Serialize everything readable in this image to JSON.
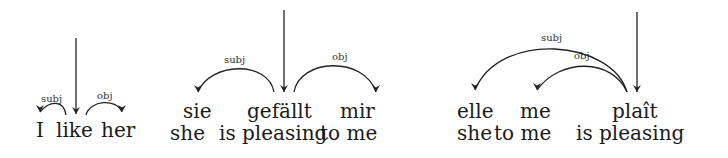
{
  "diagrams": [
    {
      "language": "English",
      "words": [
        {
          "text": "I",
          "x": 36
        },
        {
          "text": "like",
          "x": 56
        },
        {
          "text": "her",
          "x": 101
        }
      ],
      "glosses": [],
      "root_word": "like",
      "arcs": [
        {
          "label": "subj",
          "from": "like",
          "to": "I"
        },
        {
          "label": "obj",
          "from": "like",
          "to": "her"
        }
      ]
    },
    {
      "language": "German",
      "words": [
        {
          "text": "sie",
          "x": 183
        },
        {
          "text": "gefällt",
          "x": 247
        },
        {
          "text": "mir",
          "x": 340
        }
      ],
      "glosses": [
        {
          "text": "she",
          "x": 170
        },
        {
          "text": "is pleasing",
          "x": 219
        },
        {
          "text": "to me",
          "x": 320
        }
      ],
      "root_word": "gefällt",
      "arcs": [
        {
          "label": "subj",
          "from": "gefällt",
          "to": "sie"
        },
        {
          "label": "obj",
          "from": "gefällt",
          "to": "mir"
        }
      ]
    },
    {
      "language": "French",
      "words": [
        {
          "text": "elle",
          "x": 457
        },
        {
          "text": "me",
          "x": 520
        },
        {
          "text": "plaît",
          "x": 612
        }
      ],
      "glosses": [
        {
          "text": "she",
          "x": 457
        },
        {
          "text": "to me",
          "x": 494
        },
        {
          "text": "is pleasing",
          "x": 576
        }
      ],
      "root_word": "plaît",
      "arcs": [
        {
          "label": "subj",
          "from": "plaît",
          "to": "elle"
        },
        {
          "label": "obj",
          "from": "plaît",
          "to": "me"
        }
      ]
    }
  ],
  "labels": {
    "en_subj": "subj",
    "en_obj": "obj",
    "de_subj": "subj",
    "de_obj": "obj",
    "fr_subj": "subj",
    "fr_obj": "obj"
  },
  "text": {
    "en_w1": "I",
    "en_w2": "like",
    "en_w3": "her",
    "de_w1": "sie",
    "de_w2": "gefällt",
    "de_w3": "mir",
    "de_g1": "she",
    "de_g2": "is pleasing",
    "de_g3": "to me",
    "fr_w1": "elle",
    "fr_w2": "me",
    "fr_w3": "plaît",
    "fr_g1": "she",
    "fr_g2": "to me",
    "fr_g3": "is pleasing"
  }
}
